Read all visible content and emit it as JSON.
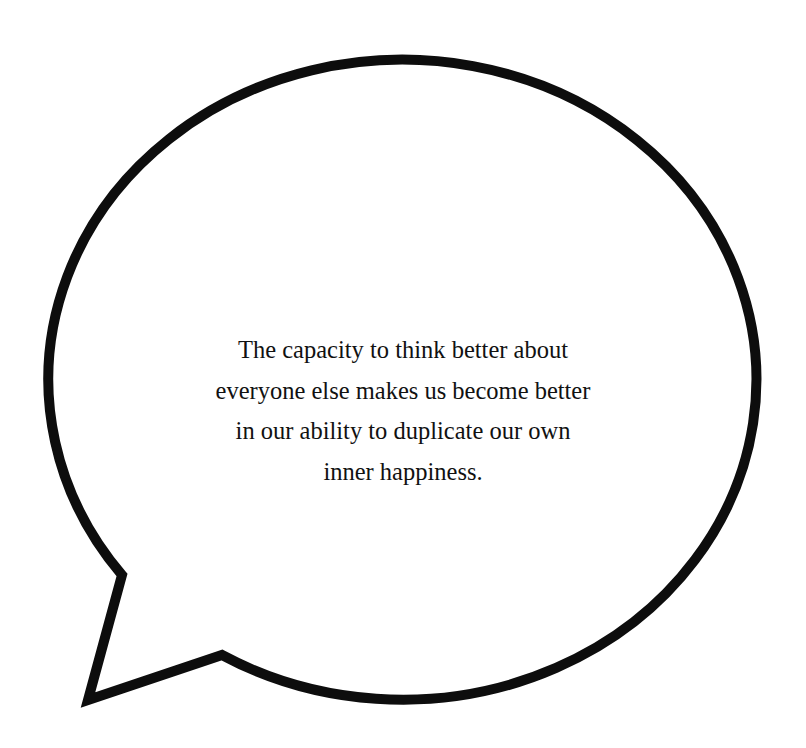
{
  "speech_bubble": {
    "stroke_color": "#0d0d0d",
    "fill_color": "#ffffff",
    "quote_lines": [
      "The capacity to think better about",
      "everyone else makes us become better",
      "in our ability to duplicate our own",
      "inner happiness."
    ]
  }
}
